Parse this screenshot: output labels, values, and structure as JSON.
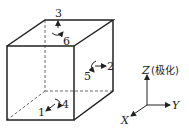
{
  "diagram": {
    "type": "piezoelectric-cube-directions",
    "face_labels": {
      "top_axis": "3",
      "top_rotation": "6",
      "side_axis": "2",
      "side_rotation": "5",
      "front_axis": "1",
      "front_rotation": "4"
    },
    "axes": {
      "z": "Z",
      "z_note": "(极化)",
      "y": "Y",
      "x": "X"
    }
  }
}
